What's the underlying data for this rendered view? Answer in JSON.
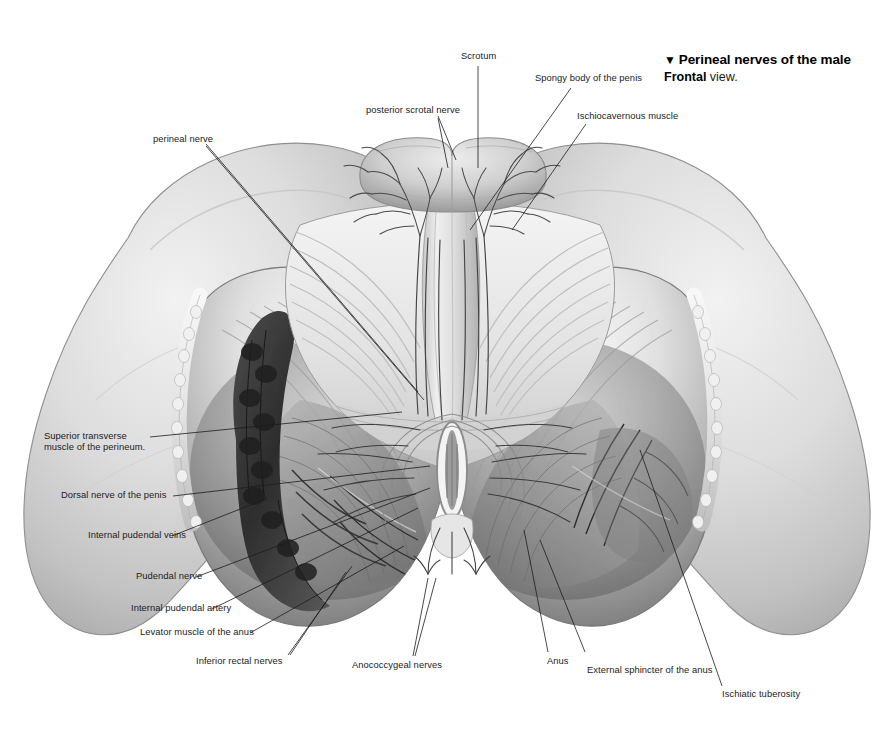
{
  "plate": {
    "title_marker": "▼",
    "title": "Perineal nerves of the male",
    "view_label": "Frontal",
    "view_suffix": " view.",
    "background_color": "#ffffff",
    "ink_color": "#1c1c1c",
    "width": 894,
    "height": 734
  },
  "labels": [
    {
      "id": "scrotum",
      "text": "Scrotum"
    },
    {
      "id": "spongy-body-of-the-penis",
      "text": "Spongy body of the penis"
    },
    {
      "id": "ischiocavernous-muscle",
      "text": "Ischiocavernous muscle"
    },
    {
      "id": "posterior-scrotal-nerve",
      "text": "posterior scrotal nerve"
    },
    {
      "id": "perineal-nerve",
      "text": "perineal nerve"
    },
    {
      "id": "superior-transverse-muscle-of-the-perineum",
      "text": "Superior transverse muscle of the perineum."
    },
    {
      "id": "dorsal-nerve-of-the-penis",
      "text": "Dorsal nerve of the penis"
    },
    {
      "id": "internal-pudendal-veins",
      "text": "Internal pudendal veins"
    },
    {
      "id": "pudendal-nerve",
      "text": "Pudendal nerve"
    },
    {
      "id": "internal-pudendal-artery",
      "text": "Internal pudendal artery"
    },
    {
      "id": "levator-muscle-of-the-anus",
      "text": "Levator muscle of the anus"
    },
    {
      "id": "inferior-rectal-nerves",
      "text": "Inferior rectal nerves"
    },
    {
      "id": "anococcygeal-nerves",
      "text": "Anococcygeal nerves"
    },
    {
      "id": "anus",
      "text": "Anus"
    },
    {
      "id": "external-sphincter-of-the-anus",
      "text": "External sphincter of the anus"
    },
    {
      "id": "ischiatic-tuberosity",
      "text": "Ischiatic tuberosity"
    }
  ]
}
